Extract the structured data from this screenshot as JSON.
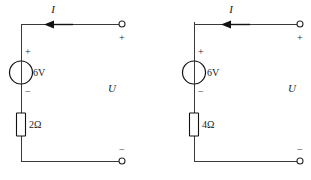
{
  "figure": {
    "type": "circuit-diagram",
    "background_color": "#ffffff",
    "line_color": "#3a3a3a",
    "text_color": "#1a1a1a",
    "width": 311,
    "height": 180
  },
  "circuits": [
    {
      "id": "circuit-left",
      "current_label": "I",
      "current_direction": "leftward",
      "source": {
        "label": "6V",
        "symbol": "circle",
        "plus_sign": "+",
        "minus_sign": "−"
      },
      "resistor": {
        "label": "2Ω",
        "symbol": "rectangle"
      },
      "port_voltage_label": "U",
      "terminals": [
        {
          "name": "top-terminal",
          "sign": "+"
        },
        {
          "name": "bottom-terminal",
          "sign": "−"
        }
      ]
    },
    {
      "id": "circuit-right",
      "current_label": "I",
      "current_direction": "leftward",
      "source": {
        "label": "6V",
        "symbol": "circle",
        "plus_sign": "+",
        "minus_sign": "−"
      },
      "resistor": {
        "label": "4Ω",
        "symbol": "rectangle"
      },
      "port_voltage_label": "U",
      "terminals": [
        {
          "name": "top-terminal",
          "sign": "+"
        },
        {
          "name": "bottom-terminal",
          "sign": "−"
        }
      ]
    }
  ]
}
